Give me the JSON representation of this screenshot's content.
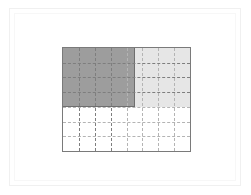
{
  "figure": {
    "title": "",
    "background_color": "#ffffff",
    "outer_frame_color": "#f0f0f0",
    "inner_frame_color": "#f7f7f7"
  },
  "plot": {
    "border_color": "#7a7a7a",
    "gridline_color": "#b4b4b4",
    "gridline_style": "dashed"
  },
  "chart_data": {
    "type": "heatmap",
    "title": "",
    "subtitle": "",
    "xlabel": "",
    "ylabel": "",
    "grid": true,
    "legend": "none",
    "columns": 8,
    "rows": 7,
    "xlim": [
      0,
      8
    ],
    "ylim": [
      0,
      7
    ],
    "xtick_labels": [],
    "ytick_labels": [],
    "annotations": [],
    "colors": {
      "dark_fill": "#9d9d9d",
      "light_fill": "#e6e6e6",
      "empty_fill": "#ffffff",
      "block_outline": "#6e6e6e"
    },
    "regions": [
      {
        "name": "dark-block",
        "fill": "#9d9d9d",
        "value": 2,
        "x_start": 0,
        "x_end": 4,
        "y_start": 0,
        "y_end": 4,
        "width_cells": 4,
        "height_cells": 4
      },
      {
        "name": "light-block",
        "fill": "#e6e6e6",
        "value": 1,
        "x_start": 4,
        "x_end": 8,
        "y_start": 0,
        "y_end": 4,
        "width_cells": 4,
        "height_cells": 4
      },
      {
        "name": "empty-block",
        "fill": "#ffffff",
        "value": 0,
        "x_start": 0,
        "x_end": 8,
        "y_start": 4,
        "y_end": 7,
        "width_cells": 8,
        "height_cells": 3
      }
    ],
    "matrix": [
      [
        2,
        2,
        2,
        2,
        1,
        1,
        1,
        1
      ],
      [
        2,
        2,
        2,
        2,
        1,
        1,
        1,
        1
      ],
      [
        2,
        2,
        2,
        2,
        1,
        1,
        1,
        1
      ],
      [
        2,
        2,
        2,
        2,
        1,
        1,
        1,
        1
      ],
      [
        0,
        0,
        0,
        0,
        0,
        0,
        0,
        0
      ],
      [
        0,
        0,
        0,
        0,
        0,
        0,
        0,
        0
      ],
      [
        0,
        0,
        0,
        0,
        0,
        0,
        0,
        0
      ]
    ]
  }
}
